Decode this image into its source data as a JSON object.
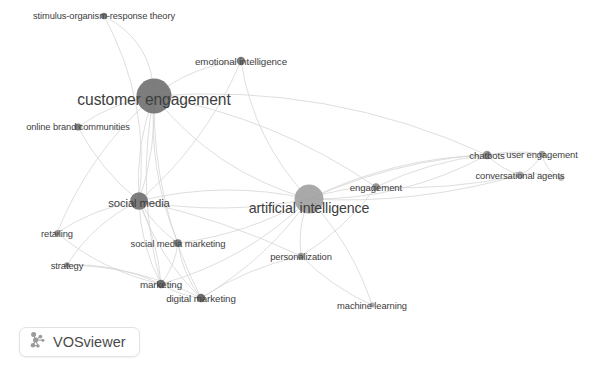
{
  "app": {
    "name": "VOSviewer",
    "badge_label": "VOSviewer",
    "badge_icon": "vosviewer-logo-icon",
    "canvas_width": 592,
    "canvas_height": 367,
    "background_color": "#ffffff",
    "node_color": "#8c8c8c",
    "node_color_dark": "#6f6f6f",
    "edge_color": "#d6d6d6",
    "label_color": "#3d3d3d"
  },
  "chart_data": {
    "type": "scatter",
    "title": "",
    "xlabel": "",
    "ylabel": "",
    "visualization": "bibliometric co-occurrence network",
    "legend": [],
    "grid": false,
    "xlim": [
      0,
      592
    ],
    "ylim": [
      0,
      367
    ],
    "nodes": [
      {
        "label": "stimulus-organism-response theory",
        "x": 104,
        "y": 16,
        "r": 3.2,
        "font": 9.3,
        "color": "#6f6f6f",
        "label_dx": 0,
        "label_dy": 0
      },
      {
        "label": "emotional intelligence",
        "x": 241,
        "y": 61,
        "r": 4.2,
        "font": 9.8,
        "color": "#6f6f6f",
        "label_dx": 0,
        "label_dy": 0
      },
      {
        "label": "customer engagement",
        "x": 154,
        "y": 96,
        "r": 17.5,
        "font": 15.6,
        "color": "#6f6f6f",
        "label_dx": 0,
        "label_dy": 4
      },
      {
        "label": "online brand communities",
        "x": 78,
        "y": 127,
        "r": 3.6,
        "font": 9.3,
        "color": "#6f6f6f",
        "label_dx": 0,
        "label_dy": 0
      },
      {
        "label": "social media",
        "x": 139,
        "y": 201,
        "r": 8.8,
        "font": 11.3,
        "color": "#6f6f6f",
        "label_dx": 0,
        "label_dy": 2
      },
      {
        "label": "artificial intelligence",
        "x": 309,
        "y": 199,
        "r": 14.5,
        "font": 14.2,
        "color": "#a0a0a0",
        "label_dx": 0,
        "label_dy": 9
      },
      {
        "label": "engagement",
        "x": 376,
        "y": 187,
        "r": 3.8,
        "font": 9.6,
        "color": "#8c8c8c",
        "label_dx": 0,
        "label_dy": 0
      },
      {
        "label": "chatbots",
        "x": 487,
        "y": 155,
        "r": 4.3,
        "font": 9.6,
        "color": "#8c8c8c",
        "label_dx": 0,
        "label_dy": 0
      },
      {
        "label": "user engagement",
        "x": 542,
        "y": 154,
        "r": 3.3,
        "font": 9.4,
        "color": "#9a9a9a",
        "label_dx": 0,
        "label_dy": 0
      },
      {
        "label": "conversational agents",
        "x": 520,
        "y": 175,
        "r": 3.6,
        "font": 9.4,
        "color": "#9a9a9a",
        "label_dx": 0,
        "label_dy": 0
      },
      {
        "label": "",
        "x": 561,
        "y": 178,
        "r": 3.0,
        "font": 0,
        "color": "#bdbdbd",
        "label_dx": 0,
        "label_dy": 0
      },
      {
        "label": "personalization",
        "x": 301,
        "y": 256,
        "r": 3.2,
        "font": 9.4,
        "color": "#8c8c8c",
        "label_dx": 0,
        "label_dy": 0
      },
      {
        "label": "retailing",
        "x": 57,
        "y": 233,
        "r": 2.8,
        "font": 9.4,
        "color": "#8c8c8c",
        "label_dx": 0,
        "label_dy": 0
      },
      {
        "label": "social media marketing",
        "x": 178,
        "y": 243,
        "r": 3.7,
        "font": 9.5,
        "color": "#6f6f6f",
        "label_dx": 0,
        "label_dy": 0
      },
      {
        "label": "strategy",
        "x": 67,
        "y": 265,
        "r": 2.8,
        "font": 9.4,
        "color": "#8c8c8c",
        "label_dx": 0,
        "label_dy": 0
      },
      {
        "label": "marketing",
        "x": 161,
        "y": 284,
        "r": 4.3,
        "font": 9.8,
        "color": "#5e5e5e",
        "label_dx": 0,
        "label_dy": 0
      },
      {
        "label": "digital marketing",
        "x": 201,
        "y": 298,
        "r": 4.3,
        "font": 9.8,
        "color": "#5e5e5e",
        "label_dx": 0,
        "label_dy": 0
      },
      {
        "label": "machine learning",
        "x": 372,
        "y": 305,
        "r": 2.6,
        "font": 9.4,
        "color": "#9a9a9a",
        "label_dx": 0,
        "label_dy": 0
      }
    ],
    "edges": [
      {
        "from": "customer engagement",
        "to": "stimulus-organism-response theory",
        "bow": 28
      },
      {
        "from": "customer engagement",
        "to": "emotional intelligence",
        "bow": -14
      },
      {
        "from": "customer engagement",
        "to": "online brand communities",
        "bow": 10
      },
      {
        "from": "customer engagement",
        "to": "social media",
        "bow": 12
      },
      {
        "from": "customer engagement",
        "to": "social media",
        "bow": -10
      },
      {
        "from": "customer engagement",
        "to": "artificial intelligence",
        "bow": 30
      },
      {
        "from": "customer engagement",
        "to": "social media marketing",
        "bow": 18
      },
      {
        "from": "customer engagement",
        "to": "marketing",
        "bow": 22
      },
      {
        "from": "customer engagement",
        "to": "digital marketing",
        "bow": 26
      },
      {
        "from": "customer engagement",
        "to": "engagement",
        "bow": -26
      },
      {
        "from": "customer engagement",
        "to": "chatbots",
        "bow": -44
      },
      {
        "from": "customer engagement",
        "to": "retailing",
        "bow": 20
      },
      {
        "from": "emotional intelligence",
        "to": "artificial intelligence",
        "bow": 24
      },
      {
        "from": "emotional intelligence",
        "to": "social media",
        "bow": -20
      },
      {
        "from": "artificial intelligence",
        "to": "social media",
        "bow": -16
      },
      {
        "from": "artificial intelligence",
        "to": "social media",
        "bow": 20
      },
      {
        "from": "artificial intelligence",
        "to": "engagement",
        "bow": -6
      },
      {
        "from": "artificial intelligence",
        "to": "chatbots",
        "bow": -20
      },
      {
        "from": "artificial intelligence",
        "to": "chatbots",
        "bow": 24
      },
      {
        "from": "artificial intelligence",
        "to": "conversational agents",
        "bow": 18
      },
      {
        "from": "artificial intelligence",
        "to": "user engagement",
        "bow": -28
      },
      {
        "from": "artificial intelligence",
        "to": "personalization",
        "bow": 8
      },
      {
        "from": "artificial intelligence",
        "to": "machine learning",
        "bow": -14
      },
      {
        "from": "artificial intelligence",
        "to": "marketing",
        "bow": -22
      },
      {
        "from": "artificial intelligence",
        "to": "digital marketing",
        "bow": -16
      },
      {
        "from": "artificial intelligence",
        "to": "social media marketing",
        "bow": -14
      },
      {
        "from": "social media",
        "to": "social media marketing",
        "bow": 6
      },
      {
        "from": "social media",
        "to": "marketing",
        "bow": 10
      },
      {
        "from": "social media",
        "to": "marketing",
        "bow": -8
      },
      {
        "from": "social media",
        "to": "digital marketing",
        "bow": 14
      },
      {
        "from": "social media",
        "to": "retailing",
        "bow": 10
      },
      {
        "from": "social media",
        "to": "strategy",
        "bow": 14
      },
      {
        "from": "social media",
        "to": "personalization",
        "bow": -10
      },
      {
        "from": "social media",
        "to": "online brand communities",
        "bow": -10
      },
      {
        "from": "social media marketing",
        "to": "marketing",
        "bow": -6
      },
      {
        "from": "social media marketing",
        "to": "digital marketing",
        "bow": 8
      },
      {
        "from": "marketing",
        "to": "digital marketing",
        "bow": 5
      },
      {
        "from": "marketing",
        "to": "strategy",
        "bow": 12
      },
      {
        "from": "marketing",
        "to": "retailing",
        "bow": -14
      },
      {
        "from": "digital marketing",
        "to": "personalization",
        "bow": -10
      },
      {
        "from": "digital marketing",
        "to": "strategy",
        "bow": 16
      },
      {
        "from": "chatbots",
        "to": "conversational agents",
        "bow": 5
      },
      {
        "from": "chatbots",
        "to": "user engagement",
        "bow": -5
      },
      {
        "from": "conversational agents",
        "to": "user engagement",
        "bow": 5
      },
      {
        "from": "conversational agents",
        "to": "",
        "bow": -5
      },
      {
        "from": "engagement",
        "to": "chatbots",
        "bow": -10
      },
      {
        "from": "engagement",
        "to": "conversational agents",
        "bow": 10
      },
      {
        "from": "engagement",
        "to": "personalization",
        "bow": -10
      },
      {
        "from": "personalization",
        "to": "machine learning",
        "bow": 8
      },
      {
        "from": "stimulus-organism-response theory",
        "to": "social media",
        "bow": -30
      },
      {
        "from": "user engagement",
        "to": "",
        "bow": 8
      }
    ]
  }
}
